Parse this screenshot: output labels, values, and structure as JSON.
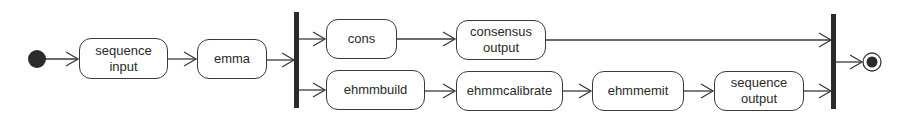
{
  "diagram": {
    "type": "uml-activity",
    "nodes": [
      {
        "id": "seq_in",
        "label": "sequence\ninput",
        "x": 79,
        "y": 38,
        "w": 89,
        "h": 41
      },
      {
        "id": "emma",
        "label": "emma",
        "x": 197,
        "y": 39,
        "w": 70,
        "h": 40
      },
      {
        "id": "cons",
        "label": "cons",
        "x": 326,
        "y": 19,
        "w": 71,
        "h": 40
      },
      {
        "id": "cons_out",
        "label": "consensus\noutput",
        "x": 456,
        "y": 20,
        "w": 90,
        "h": 40
      },
      {
        "id": "ehmmbuild",
        "label": "ehmmbuild",
        "x": 326,
        "y": 70,
        "w": 99,
        "h": 40
      },
      {
        "id": "ehmmcalibrate",
        "label": "ehmmcalibrate",
        "x": 456,
        "y": 71,
        "w": 107,
        "h": 40
      },
      {
        "id": "ehmmemit",
        "label": "ehmmemit",
        "x": 592,
        "y": 71,
        "w": 92,
        "h": 40
      },
      {
        "id": "seq_out",
        "label": "sequence\noutput",
        "x": 714,
        "y": 71,
        "w": 90,
        "h": 40
      }
    ],
    "edges": [
      [
        "start",
        "seq_in"
      ],
      [
        "seq_in",
        "emma"
      ],
      [
        "emma",
        "fork"
      ],
      [
        "fork",
        "cons"
      ],
      [
        "fork",
        "ehmmbuild"
      ],
      [
        "cons",
        "cons_out"
      ],
      [
        "cons_out",
        "join"
      ],
      [
        "ehmmbuild",
        "ehmmcalibrate"
      ],
      [
        "ehmmcalibrate",
        "ehmmemit"
      ],
      [
        "ehmmemit",
        "seq_out"
      ],
      [
        "seq_out",
        "join"
      ],
      [
        "join",
        "end"
      ]
    ],
    "colors": {
      "stroke": "#3a3a3a",
      "bar": "#2b2b2b",
      "fill": "#ffffff"
    }
  }
}
